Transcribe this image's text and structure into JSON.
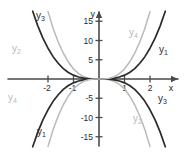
{
  "figure": {
    "title": "",
    "background_color": "#ffffff",
    "axis_color": "#4a4a4a",
    "dark_curve_color": "#2b2b2b",
    "light_curve_color": "#b9b9b9"
  },
  "axes": {
    "x_axis_label": "x",
    "y_axis_label": "y",
    "x_ticks": [
      "-2",
      "-1",
      "1",
      "2"
    ],
    "x_tick_values": [
      -2,
      -1,
      1,
      2
    ],
    "y_ticks": [
      "15",
      "10",
      "5",
      "-5",
      "-10",
      "-15"
    ],
    "y_tick_values": [
      15,
      10,
      5,
      -5,
      -10,
      -15
    ]
  },
  "curve_labels": [
    {
      "id": "y3-upper-left",
      "text": "y",
      "sub": "3",
      "x": 36,
      "y": 11,
      "color": "#2b2b2b"
    },
    {
      "id": "y2-upper-left",
      "text": "y",
      "sub": "2",
      "x": 12,
      "y": 44,
      "color": "#b9b9b9"
    },
    {
      "id": "y4-lower-left",
      "text": "y",
      "sub": "4",
      "x": 8,
      "y": 93,
      "color": "#b9b9b9"
    },
    {
      "id": "y1-lower-left",
      "text": "y",
      "sub": "1",
      "x": 37,
      "y": 127,
      "color": "#2b2b2b"
    },
    {
      "id": "y4-upper-right",
      "text": "y",
      "sub": "4",
      "x": 129,
      "y": 28,
      "color": "#b9b9b9"
    },
    {
      "id": "y1-upper-right",
      "text": "y",
      "sub": "1",
      "x": 159,
      "y": 45,
      "color": "#2b2b2b"
    },
    {
      "id": "y2-lower-right",
      "text": "y",
      "sub": "2",
      "x": 133,
      "y": 114,
      "color": "#b9b9b9"
    },
    {
      "id": "y3-lower-right",
      "text": "y",
      "sub": "3",
      "x": 158,
      "y": 94,
      "color": "#2b2b2b"
    }
  ],
  "chart_data": {
    "type": "line",
    "title": "",
    "xlabel": "x",
    "ylabel": "y",
    "xlim": [
      -2.8,
      2.8
    ],
    "ylim": [
      -18,
      18
    ],
    "grid": false,
    "legend": "inline-curve-labels",
    "x_ticks": [
      -2,
      -1,
      1,
      2
    ],
    "y_ticks": [
      -15,
      -10,
      -5,
      5,
      10,
      15
    ],
    "series": [
      {
        "name": "y1",
        "color": "#2b2b2b",
        "style": "solid",
        "quadrants": [
          "I",
          "III"
        ],
        "description": "odd power curve rising steeply in quadrant I and falling in quadrant III, outermost dark curve on the right",
        "points": [
          {
            "x": -2.6,
            "y": -17.6
          },
          {
            "x": -2.4,
            "y": -13.8
          },
          {
            "x": -2.2,
            "y": -10.6
          },
          {
            "x": -2.0,
            "y": -8.0
          },
          {
            "x": -1.8,
            "y": -5.8
          },
          {
            "x": -1.6,
            "y": -4.1
          },
          {
            "x": -1.4,
            "y": -2.7
          },
          {
            "x": -1.2,
            "y": -1.7
          },
          {
            "x": -1.0,
            "y": -1.0
          },
          {
            "x": -0.8,
            "y": -0.51
          },
          {
            "x": -0.6,
            "y": -0.22
          },
          {
            "x": -0.4,
            "y": -0.06
          },
          {
            "x": -0.2,
            "y": -0.01
          },
          {
            "x": 0.0,
            "y": 0.0
          },
          {
            "x": 0.2,
            "y": 0.01
          },
          {
            "x": 0.4,
            "y": 0.06
          },
          {
            "x": 0.6,
            "y": 0.22
          },
          {
            "x": 0.8,
            "y": 0.51
          },
          {
            "x": 1.0,
            "y": 1.0
          },
          {
            "x": 1.2,
            "y": 1.7
          },
          {
            "x": 1.4,
            "y": 2.7
          },
          {
            "x": 1.6,
            "y": 4.1
          },
          {
            "x": 1.8,
            "y": 5.8
          },
          {
            "x": 2.0,
            "y": 8.0
          },
          {
            "x": 2.2,
            "y": 10.6
          },
          {
            "x": 2.4,
            "y": 13.8
          },
          {
            "x": 2.6,
            "y": 17.6
          }
        ]
      },
      {
        "name": "y2",
        "color": "#b9b9b9",
        "style": "solid",
        "quadrants": [
          "II",
          "IV"
        ],
        "description": "light grey curve high in quadrant II and descending in quadrant IV, steepest light curve",
        "points": [
          {
            "x": -2.0,
            "y": 17.5
          },
          {
            "x": -1.8,
            "y": 13.2
          },
          {
            "x": -1.6,
            "y": 9.6
          },
          {
            "x": -1.4,
            "y": 6.7
          },
          {
            "x": -1.2,
            "y": 4.4
          },
          {
            "x": -1.0,
            "y": 2.6
          },
          {
            "x": -0.8,
            "y": 1.4
          },
          {
            "x": -0.6,
            "y": 0.6
          },
          {
            "x": -0.4,
            "y": 0.18
          },
          {
            "x": -0.2,
            "y": 0.02
          },
          {
            "x": 0.0,
            "y": 0.0
          },
          {
            "x": 0.2,
            "y": -0.02
          },
          {
            "x": 0.4,
            "y": -0.18
          },
          {
            "x": 0.6,
            "y": -0.6
          },
          {
            "x": 0.8,
            "y": -1.4
          },
          {
            "x": 1.0,
            "y": -2.6
          },
          {
            "x": 1.2,
            "y": -4.4
          },
          {
            "x": 1.4,
            "y": -6.7
          },
          {
            "x": 1.6,
            "y": -9.6
          },
          {
            "x": 1.8,
            "y": -13.2
          },
          {
            "x": 2.0,
            "y": -17.5
          }
        ]
      },
      {
        "name": "y3",
        "color": "#2b2b2b",
        "style": "solid",
        "quadrants": [
          "II",
          "IV"
        ],
        "description": "dark curve high in quadrant II and descending in quadrant IV, inner dark mirror of y1",
        "points": [
          {
            "x": -2.6,
            "y": 17.6
          },
          {
            "x": -2.4,
            "y": 13.8
          },
          {
            "x": -2.2,
            "y": 10.6
          },
          {
            "x": -2.0,
            "y": 8.0
          },
          {
            "x": -1.8,
            "y": 5.8
          },
          {
            "x": -1.6,
            "y": 4.1
          },
          {
            "x": -1.4,
            "y": 2.7
          },
          {
            "x": -1.2,
            "y": 1.7
          },
          {
            "x": -1.0,
            "y": 1.0
          },
          {
            "x": -0.8,
            "y": 0.51
          },
          {
            "x": -0.6,
            "y": 0.22
          },
          {
            "x": -0.4,
            "y": 0.06
          },
          {
            "x": -0.2,
            "y": 0.01
          },
          {
            "x": 0.0,
            "y": 0.0
          },
          {
            "x": 0.2,
            "y": -0.01
          },
          {
            "x": 0.4,
            "y": -0.06
          },
          {
            "x": 0.6,
            "y": -0.22
          },
          {
            "x": 0.8,
            "y": -0.51
          },
          {
            "x": 1.0,
            "y": -1.0
          },
          {
            "x": 1.2,
            "y": -1.7
          },
          {
            "x": 1.4,
            "y": -2.7
          },
          {
            "x": 1.6,
            "y": -4.1
          },
          {
            "x": 1.8,
            "y": -5.8
          },
          {
            "x": 2.0,
            "y": -8.0
          },
          {
            "x": 2.2,
            "y": -10.6
          },
          {
            "x": 2.4,
            "y": -13.8
          },
          {
            "x": 2.6,
            "y": -17.6
          }
        ]
      },
      {
        "name": "y4",
        "color": "#b9b9b9",
        "style": "solid",
        "quadrants": [
          "I",
          "III"
        ],
        "description": "light grey curve rising in quadrant I and falling in quadrant III, steepest light curve on the right",
        "points": [
          {
            "x": -2.0,
            "y": -17.5
          },
          {
            "x": -1.8,
            "y": -13.2
          },
          {
            "x": -1.6,
            "y": -9.6
          },
          {
            "x": -1.4,
            "y": -6.7
          },
          {
            "x": -1.2,
            "y": -4.4
          },
          {
            "x": -1.0,
            "y": -2.6
          },
          {
            "x": -0.8,
            "y": -1.4
          },
          {
            "x": -0.6,
            "y": -0.6
          },
          {
            "x": -0.4,
            "y": -0.18
          },
          {
            "x": -0.2,
            "y": -0.02
          },
          {
            "x": 0.0,
            "y": 0.0
          },
          {
            "x": 0.2,
            "y": 0.02
          },
          {
            "x": 0.4,
            "y": 0.18
          },
          {
            "x": 0.6,
            "y": 0.6
          },
          {
            "x": 0.8,
            "y": 1.4
          },
          {
            "x": 1.0,
            "y": 2.6
          },
          {
            "x": 1.2,
            "y": 4.4
          },
          {
            "x": 1.4,
            "y": 6.7
          },
          {
            "x": 1.6,
            "y": 9.6
          },
          {
            "x": 1.8,
            "y": 13.2
          },
          {
            "x": 2.0,
            "y": 17.5
          }
        ]
      }
    ]
  }
}
